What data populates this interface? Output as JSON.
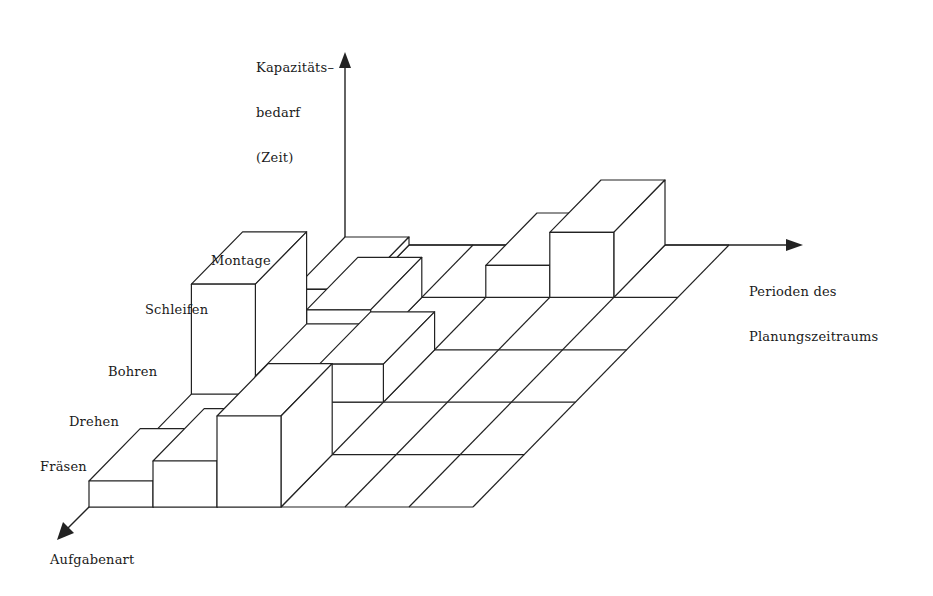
{
  "axes": {
    "vertical": {
      "lines": [
        "Kapazitäts–",
        "bedarf",
        "(Zeit)"
      ]
    },
    "horizontal": {
      "lines": [
        "Perioden des",
        "Planungszeitraums"
      ]
    },
    "depth": {
      "label": "Aufgabenart"
    }
  },
  "rows": [
    {
      "label": "Fräsen"
    },
    {
      "label": "Drehen"
    },
    {
      "label": "Bohren"
    },
    {
      "label": "Schleifen"
    },
    {
      "label": "Montage"
    }
  ],
  "grid": {
    "origin": [
      89,
      507
    ],
    "col_width": 64,
    "row_step": [
      51.2,
      -52.4
    ],
    "cols": 6,
    "rows": 5,
    "line_color": "#222222"
  },
  "boxes": [
    {
      "row": 4,
      "col": 3,
      "h": 32
    },
    {
      "row": 4,
      "col": 4,
      "h": 65
    },
    {
      "row": 4,
      "col": 0,
      "h": 8
    },
    {
      "row": 3,
      "col": 0,
      "h": 8
    },
    {
      "row": 3,
      "col": 1,
      "h": 40
    },
    {
      "row": 2,
      "col": 0,
      "h": 118
    },
    {
      "row": 2,
      "col": 1,
      "h": 26
    },
    {
      "row": 2,
      "col": 2,
      "h": 38
    },
    {
      "row": 1,
      "col": 0,
      "h": 8
    },
    {
      "row": 1,
      "col": 1,
      "h": 8
    },
    {
      "row": 0,
      "col": 0,
      "h": 26
    },
    {
      "row": 0,
      "col": 1,
      "h": 46
    },
    {
      "row": 0,
      "col": 2,
      "h": 91
    }
  ]
}
